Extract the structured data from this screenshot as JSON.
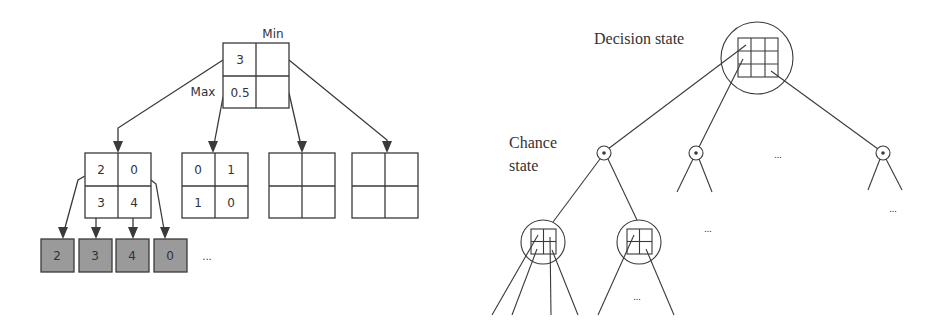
{
  "left_diagram": {
    "labels": {
      "min": "Min",
      "max": "Max",
      "ellipsis": "..."
    },
    "root": {
      "cells": [
        "3",
        "",
        "0.5",
        ""
      ]
    },
    "children": [
      {
        "cells": [
          "2",
          "0",
          "3",
          "4"
        ]
      },
      {
        "cells": [
          "0",
          "1",
          "1",
          "0"
        ]
      },
      {
        "cells": [
          "",
          "",
          "",
          ""
        ]
      },
      {
        "cells": [
          "",
          "",
          "",
          ""
        ]
      }
    ],
    "leaves": [
      "2",
      "3",
      "4",
      "0"
    ],
    "colors": {
      "stroke": "#3a3a3a",
      "leaf_fill": "#9a9a9a",
      "text": "#333333"
    }
  },
  "right_diagram": {
    "labels": {
      "decision_state": "Decision state",
      "chance_state_line1": "Chance",
      "chance_state_line2": "state",
      "chance_marker": "*",
      "ellipsis": "..."
    },
    "colors": {
      "stroke": "#3a3a3a",
      "text": "#333333"
    }
  }
}
